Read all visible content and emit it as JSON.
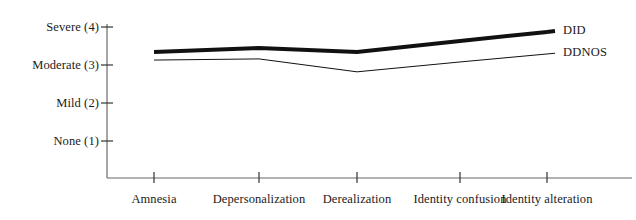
{
  "chart_data": {
    "type": "line",
    "title": "",
    "subtitle": "",
    "xlabel": "",
    "ylabel": "",
    "categories": [
      "Amnesia",
      "Depersonalization",
      "Derealization",
      "Identity confusion",
      "Identity alteration"
    ],
    "ytick_labels": [
      "Severe (4)",
      "Moderate (3)",
      "Mild (2)",
      "None (1)"
    ],
    "ytick_values": [
      4,
      3,
      2,
      1
    ],
    "ylim": [
      0.6,
      4.3
    ],
    "grid": false,
    "legend_position": "right-of-line-ends",
    "series": [
      {
        "name": "DID",
        "values": [
          3.34,
          3.45,
          3.34,
          3.63,
          3.87
        ],
        "color": "#111111",
        "line_width": 4
      },
      {
        "name": "DDNOS",
        "values": [
          3.13,
          3.16,
          2.82,
          3.08,
          3.29
        ],
        "color": "#111111",
        "line_width": 1
      }
    ]
  },
  "axis": {
    "axis_color": "#555555",
    "tick_color": "#333333"
  },
  "legend": {
    "items": [
      {
        "label": "DID"
      },
      {
        "label": "DDNOS"
      }
    ]
  }
}
